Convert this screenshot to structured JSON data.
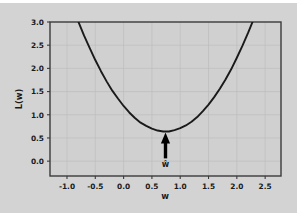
{
  "figure": {
    "background_color": "#d3d3d3",
    "page_background_color": "#ffffff",
    "axes_background_color": "#d0d0d0"
  },
  "chart_data": {
    "type": "line",
    "title": "",
    "xlabel": "w",
    "ylabel": "L(w)",
    "xlim": [
      -1.3,
      2.78
    ],
    "ylim": [
      -0.32,
      3.0
    ],
    "grid": true,
    "legend": null,
    "xticks": [
      "-1.0",
      "-0.5",
      "0.0",
      "0.5",
      "1.0",
      "1.5",
      "2.0",
      "2.5"
    ],
    "xtick_values": [
      -1.0,
      -0.5,
      0.0,
      0.5,
      1.0,
      1.5,
      2.0,
      2.5
    ],
    "yticks": [
      "0.0",
      "0.5",
      "1.0",
      "1.5",
      "2.0",
      "2.5",
      "3.0"
    ],
    "ytick_values": [
      0.0,
      0.5,
      1.0,
      1.5,
      2.0,
      2.5,
      3.0
    ],
    "curve": {
      "name": "L(w)",
      "shape": "parabola",
      "color": "#1a1a1a",
      "line_width": 1.9,
      "vertex_x": 0.74,
      "vertex_y": 0.64,
      "curvature_a": 1.0,
      "x": [
        -0.83,
        -0.7,
        -0.6,
        -0.5,
        -0.4,
        -0.3,
        -0.2,
        -0.1,
        0.0,
        0.1,
        0.2,
        0.3,
        0.4,
        0.5,
        0.6,
        0.7,
        0.74,
        0.8,
        0.9,
        1.0,
        1.1,
        1.2,
        1.3,
        1.4,
        1.5,
        1.6,
        1.7,
        1.8,
        1.9,
        2.0,
        2.1,
        2.2,
        2.31
      ],
      "y": [
        3.1,
        2.71,
        2.44,
        2.18,
        1.94,
        1.72,
        1.52,
        1.35,
        1.19,
        1.05,
        0.93,
        0.83,
        0.76,
        0.7,
        0.66,
        0.64,
        0.64,
        0.64,
        0.67,
        0.71,
        0.77,
        0.85,
        0.95,
        1.08,
        1.22,
        1.38,
        1.56,
        1.76,
        1.98,
        2.23,
        2.49,
        2.77,
        3.1
      ]
    },
    "annotations": [
      {
        "type": "arrow",
        "label": "ŵ",
        "points_to_x": 0.74,
        "points_to_y": 0.62,
        "tail_y": 0.06,
        "label_x": 0.74,
        "label_y": -0.12,
        "color": "#000000"
      }
    ]
  }
}
